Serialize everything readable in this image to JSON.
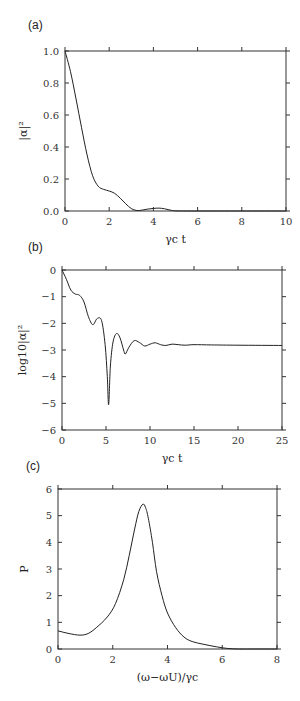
{
  "panels": [
    {
      "label": "(a)",
      "ylabel": "|α|²",
      "xlabel": "γc t"
    },
    {
      "label": "(b)",
      "ylabel": "log10|α|²",
      "xlabel": "γc t"
    },
    {
      "label": "(c)",
      "ylabel": "P",
      "xlabel": "(ω−ωU)/γc"
    }
  ],
  "chart_data": [
    {
      "type": "line",
      "title": "(a)",
      "xlabel": "γc t",
      "ylabel": "|α|²",
      "xlim": [
        0,
        10
      ],
      "ylim": [
        0.0,
        1.0
      ],
      "xticks": [
        "0",
        "2",
        "4",
        "6",
        "8",
        "10"
      ],
      "yticks": [
        "0.0",
        "0.2",
        "0.4",
        "0.6",
        "0.8",
        "1.0"
      ],
      "grid": false,
      "series": [
        {
          "name": "|α|²",
          "x": [
            0,
            0.25,
            0.5,
            0.75,
            1.0,
            1.25,
            1.5,
            1.75,
            2.0,
            2.25,
            2.5,
            2.75,
            3.0,
            3.25,
            3.5,
            3.75,
            4.0,
            4.25,
            4.5,
            4.75,
            5.0,
            5.5,
            6,
            7,
            8,
            10
          ],
          "y": [
            1.0,
            0.87,
            0.7,
            0.52,
            0.35,
            0.22,
            0.155,
            0.135,
            0.125,
            0.11,
            0.08,
            0.045,
            0.015,
            0.003,
            0.006,
            0.012,
            0.016,
            0.018,
            0.014,
            0.006,
            0.001,
            0.0,
            0.0,
            0.0,
            0.0,
            0.0
          ]
        }
      ]
    },
    {
      "type": "line",
      "title": "(b)",
      "xlabel": "γc t",
      "ylabel": "log10|α|²",
      "xlim": [
        0,
        25
      ],
      "ylim": [
        -6,
        0
      ],
      "xticks": [
        "0",
        "5",
        "10",
        "15",
        "20",
        "25"
      ],
      "yticks": [
        "0",
        "-1",
        "-2",
        "-3",
        "-4",
        "-5",
        "-6"
      ],
      "grid": false,
      "series": [
        {
          "name": "log10|α|²",
          "x": [
            0,
            0.5,
            1.0,
            1.5,
            2.0,
            2.5,
            3.0,
            3.5,
            4.0,
            4.5,
            4.9,
            5.15,
            5.3,
            5.5,
            5.8,
            6.2,
            6.6,
            7.0,
            7.2,
            7.6,
            8.2,
            8.8,
            9.4,
            10.0,
            10.6,
            11.2,
            11.8,
            12.5,
            13.2,
            14,
            15,
            17,
            20,
            25
          ],
          "y": [
            0.0,
            -0.35,
            -0.75,
            -0.9,
            -0.95,
            -1.2,
            -1.75,
            -2.05,
            -1.82,
            -1.9,
            -2.8,
            -4.0,
            -5.05,
            -3.6,
            -2.7,
            -2.38,
            -2.55,
            -3.0,
            -3.15,
            -2.9,
            -2.65,
            -2.72,
            -2.85,
            -2.78,
            -2.73,
            -2.8,
            -2.83,
            -2.78,
            -2.8,
            -2.82,
            -2.8,
            -2.81,
            -2.82,
            -2.83
          ]
        }
      ]
    },
    {
      "type": "line",
      "title": "(c)",
      "xlabel": "(ω−ωU)/γc",
      "ylabel": "P",
      "xlim": [
        0,
        8
      ],
      "ylim": [
        0,
        6
      ],
      "xticks": [
        "0",
        "2",
        "4",
        "6",
        "8"
      ],
      "yticks": [
        "0",
        "1",
        "2",
        "3",
        "4",
        "5",
        "6"
      ],
      "grid": false,
      "series": [
        {
          "name": "P",
          "x": [
            0,
            0.4,
            0.8,
            1.1,
            1.4,
            1.8,
            2.1,
            2.4,
            2.6,
            2.8,
            2.95,
            3.1,
            3.2,
            3.3,
            3.45,
            3.6,
            3.8,
            4.0,
            4.3,
            4.6,
            4.9,
            5.3,
            5.8,
            6.2,
            6.6,
            7.0,
            8.0
          ],
          "y": [
            0.68,
            0.58,
            0.52,
            0.58,
            0.8,
            1.2,
            1.7,
            2.6,
            3.5,
            4.5,
            5.15,
            5.43,
            5.3,
            4.9,
            4.0,
            2.9,
            2.0,
            1.35,
            0.8,
            0.45,
            0.28,
            0.18,
            0.08,
            0.02,
            -0.02,
            -0.05,
            -0.05
          ]
        }
      ]
    }
  ]
}
